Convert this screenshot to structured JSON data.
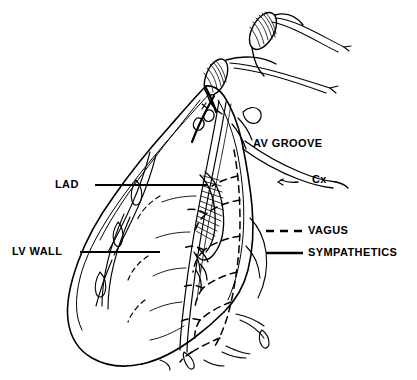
{
  "figure": {
    "background_color": "#ffffff",
    "ink_color": "#000000",
    "width": 417,
    "height": 380
  },
  "labels": {
    "lad": "LAD",
    "lv_wall": "LV WALL",
    "av_groove": "AV GROOVE",
    "cx": "Cx"
  },
  "legend": {
    "items": [
      {
        "label": "VAGUS",
        "style": "dashed"
      },
      {
        "label": "SYMPATHETICS",
        "style": "solid"
      }
    ],
    "vagus_label": "VAGUS",
    "sympathetics_label": "SYMPATHETICS"
  },
  "icons": {
    "leader_line": "leader-line-icon",
    "dashed_sample": "dashed-line-sample-icon",
    "solid_sample": "solid-line-sample-icon"
  }
}
